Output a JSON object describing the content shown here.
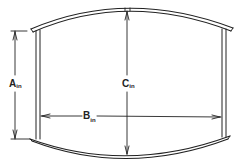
{
  "diagram": {
    "type": "dimensioned cross-section sketch",
    "colors": {
      "line": "#222222",
      "background": "#ffffff"
    },
    "dimensions": {
      "a": {
        "letter": "A",
        "unit": "in",
        "orientation": "vertical",
        "description": "side wall height"
      },
      "b": {
        "letter": "B",
        "unit": "in",
        "orientation": "horizontal",
        "description": "inner width between walls"
      },
      "c": {
        "letter": "C",
        "unit": "in",
        "orientation": "vertical",
        "description": "center height between arcs"
      }
    }
  }
}
